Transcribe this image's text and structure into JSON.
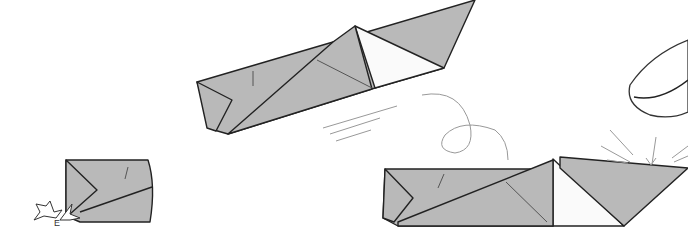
{
  "diagram": {
    "type": "origami-instructions",
    "steps": [
      {
        "id": "step-a",
        "description": "folded paper model with push arrows",
        "arrow_label": "E"
      },
      {
        "id": "step-b",
        "description": "folded boat shape flying with motion lines"
      },
      {
        "id": "step-c",
        "description": "finished boat shape tapped by finger with impact lines"
      }
    ],
    "colors": {
      "paper": "#b9b9b9",
      "paper_inside": "#fafafa",
      "outline": "#222222",
      "motion": "#999999"
    }
  }
}
